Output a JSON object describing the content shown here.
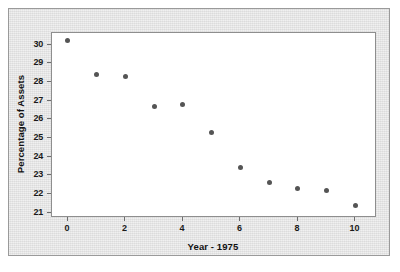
{
  "chart_data": {
    "type": "scatter",
    "title": "",
    "xlabel": "Year - 1975",
    "ylabel": "Percentage of Assets",
    "x": [
      0,
      1,
      2,
      3,
      4,
      5,
      6,
      7,
      8,
      9,
      10
    ],
    "values": [
      30.2,
      28.4,
      28.3,
      26.7,
      26.8,
      25.3,
      23.4,
      22.6,
      22.3,
      22.2,
      21.4
    ],
    "series": [
      {
        "name": "Percentage of Assets",
        "values": [
          30.2,
          28.4,
          28.3,
          26.7,
          26.8,
          25.3,
          23.4,
          22.6,
          22.3,
          22.2,
          21.4
        ]
      }
    ],
    "xlim": [
      -0.55,
      10.75
    ],
    "ylim": [
      20.72,
      30.62
    ],
    "xticks": [
      0,
      2,
      4,
      6,
      8,
      10
    ],
    "xtick_labels": [
      "0",
      "2",
      "4",
      "6",
      "8",
      "10"
    ],
    "yticks": [
      21,
      22,
      23,
      24,
      25,
      26,
      27,
      28,
      29,
      30
    ],
    "ytick_labels": [
      "21",
      "22",
      "23",
      "24",
      "25",
      "26",
      "27",
      "28",
      "29",
      "30"
    ],
    "grid": false,
    "legend": false,
    "marker_color": "#555555",
    "plot_background": "#ffffff",
    "figure_background": "#e3e3e3"
  }
}
